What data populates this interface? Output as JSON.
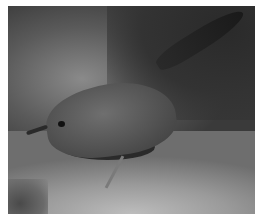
{
  "image": {
    "subject": "small brown wren-like bird perched on rock",
    "description": "Grayscale photograph of a small bird with speckled plumage and upturned tail standing on a rock against a blurred dark background",
    "colors": {
      "background": "#ffffff",
      "dark_bg": "#333333",
      "rock": "#a8a8a8",
      "bird": "#555555"
    }
  }
}
